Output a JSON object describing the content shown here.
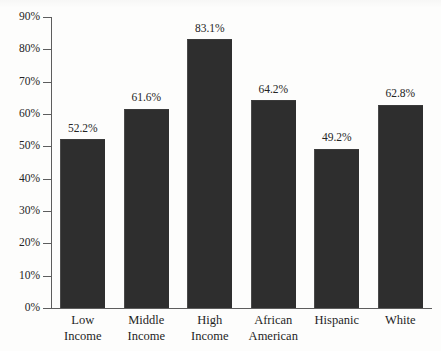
{
  "chart_data": {
    "type": "bar",
    "title": "",
    "subtitle": "",
    "xlabel": "",
    "ylabel": "",
    "ylim": [
      0,
      90
    ],
    "ytick_step": 10,
    "grid": false,
    "legend": null,
    "legend_position": "none",
    "value_label_suffix": "%",
    "categories": [
      "Low Income",
      "Middle Income",
      "High Income",
      "African American",
      "Hispanic",
      "White"
    ],
    "category_lines": [
      [
        "Low",
        "Income"
      ],
      [
        "Middle",
        "Income"
      ],
      [
        "High",
        "Income"
      ],
      [
        "African",
        "American"
      ],
      [
        "Hispanic"
      ],
      [
        "White"
      ]
    ],
    "values": [
      52.2,
      61.6,
      83.1,
      64.2,
      49.2,
      62.8
    ],
    "value_labels": [
      "52.2%",
      "61.6%",
      "83.1%",
      "64.2%",
      "49.2%",
      "62.8%"
    ],
    "ytick_labels": [
      "0%",
      "10%",
      "20%",
      "30%",
      "40%",
      "50%",
      "60%",
      "70%",
      "80%",
      "90%"
    ],
    "ytick_values": [
      0,
      10,
      20,
      30,
      40,
      50,
      60,
      70,
      80,
      90
    ],
    "colors": {
      "bar": "#2e2e2e",
      "axis": "#5d5d5d",
      "text": "#242424",
      "background": "#fdfdfc"
    }
  }
}
